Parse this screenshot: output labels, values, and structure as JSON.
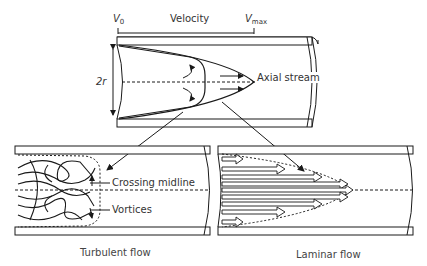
{
  "top_diagram": {
    "velocity_scale": {
      "v0_label": "V",
      "v0_sub": "0",
      "title": "Velocity",
      "vmax_label": "V",
      "vmax_sub": "max"
    },
    "diameter_label": "2r",
    "axial_stream_label": "Axial stream"
  },
  "turbulent_panel": {
    "caption": "Turbulent flow",
    "annotations": [
      "Crossing midline",
      "Vortices"
    ]
  },
  "laminar_panel": {
    "caption": "Laminar flow"
  },
  "colors": {
    "stroke": "#1a1a1a",
    "text": "#333333",
    "background": "#ffffff"
  }
}
